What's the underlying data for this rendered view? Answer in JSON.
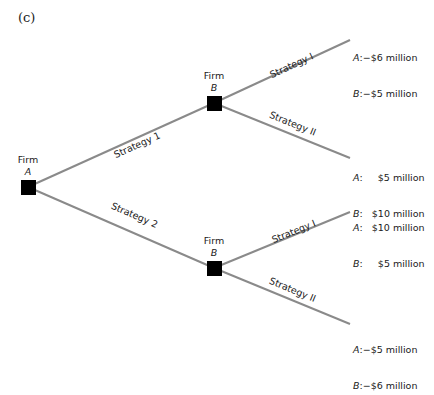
{
  "panel_label": "(c)",
  "nodes": [
    {
      "id": "firmA",
      "label": "Firm",
      "player": "A",
      "x": 28,
      "y": 187
    },
    {
      "id": "firmB_top",
      "label": "Firm",
      "player": "B",
      "x": 214,
      "y": 103
    },
    {
      "id": "firmB_bottom",
      "label": "Firm",
      "player": "B",
      "x": 214,
      "y": 268
    }
  ],
  "branches": [
    {
      "from": "firmA",
      "to": "firmB_top",
      "label": "Strategy 1"
    },
    {
      "from": "firmA",
      "to": "firmB_bottom",
      "label": "Strategy 2"
    },
    {
      "from": "firmB_top",
      "to": "payoff1",
      "label": "Strategy I"
    },
    {
      "from": "firmB_top",
      "to": "payoff2",
      "label": "Strategy II"
    },
    {
      "from": "firmB_bottom",
      "to": "payoff3",
      "label": "Strategy I"
    },
    {
      "from": "firmB_bottom",
      "to": "payoff4",
      "label": "Strategy II"
    }
  ],
  "payoffs": [
    {
      "a_label": "A",
      "a_value": ":−$6 million",
      "b_label": "B",
      "b_value": ":−$5 million"
    },
    {
      "a_label": "A",
      "a_value": ":     $5 million",
      "b_label": "B",
      "b_value": ":   $10 million"
    },
    {
      "a_label": "A",
      "a_value": ":   $10 million",
      "b_label": "B",
      "b_value": ":     $5 million"
    },
    {
      "a_label": "A",
      "a_value": ":−$5 million",
      "b_label": "B",
      "b_value": ":−$6 million"
    }
  ],
  "colors": {
    "edge": "#8a8a8a",
    "node": "#000000"
  }
}
